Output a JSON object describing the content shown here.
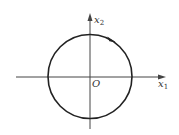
{
  "diagram": {
    "type": "phase-portrait",
    "axes": {
      "horizontal": {
        "label": "x",
        "subscript": "1"
      },
      "vertical": {
        "label": "x",
        "subscript": "2"
      },
      "origin_label": "O"
    },
    "trajectory": {
      "shape": "circle",
      "center": [
        0,
        0
      ],
      "direction": "clockwise",
      "arrow_position": "upper-right"
    },
    "colors": {
      "stroke": "#222222",
      "axis": "#444444",
      "background": "#ffffff"
    }
  }
}
